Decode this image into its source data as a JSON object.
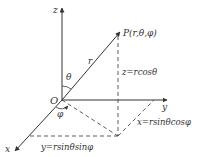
{
  "diagram": {
    "axes": {
      "x": "x",
      "y": "y",
      "z": "z"
    },
    "origin_label": "O",
    "point_label": "P(r,θ,φ)",
    "radius_label": "r",
    "theta_label": "θ",
    "phi_label": "φ",
    "equations": {
      "z": "z=rcosθ",
      "x": "x=rsinθcosφ",
      "y": "y=rsinθsinφ"
    },
    "colors": {
      "line": "#333333",
      "background": "#ffffff"
    }
  }
}
